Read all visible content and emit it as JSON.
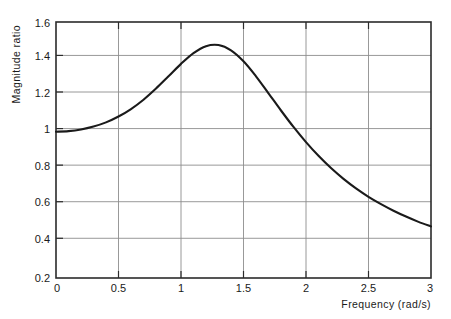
{
  "figure": {
    "clipped_header_text": "",
    "background_color": "#ffffff",
    "frame_color": "#2b2b2b",
    "grid_color": "#8d8d8d",
    "curve_color": "#1a1a1a"
  },
  "axes": {
    "x": {
      "label": "Frequency (rad/s)",
      "ticks": [
        "0",
        "0.5",
        "1",
        "1.5",
        "2",
        "2.5",
        "3"
      ],
      "tick_values": [
        0,
        0.5,
        1,
        1.5,
        2,
        2.5,
        3
      ],
      "min": 0,
      "max": 3
    },
    "y": {
      "label": "Magnitude ratio",
      "ticks": [
        "0.2",
        "0.4",
        "0.6",
        "0.8",
        "1",
        "1.2",
        "1.4",
        "1.6"
      ],
      "tick_values": [
        0.2,
        0.4,
        0.6,
        0.8,
        1,
        1.2,
        1.4,
        1.6
      ],
      "min": 0.2,
      "max": 1.6
    }
  },
  "chart_data": {
    "type": "line",
    "title": "",
    "xlabel": "Frequency (rad/s)",
    "ylabel": "Magnitude ratio",
    "xlim": [
      0,
      3
    ],
    "ylim": [
      0.2,
      1.6
    ],
    "grid": true,
    "legend": null,
    "series": [
      {
        "name": "Magnitude ratio",
        "x": [
          0,
          0.1,
          0.2,
          0.3,
          0.4,
          0.5,
          0.6,
          0.7,
          0.8,
          0.9,
          1.0,
          1.1,
          1.2,
          1.3,
          1.4,
          1.5,
          1.6,
          1.7,
          1.8,
          1.9,
          2.0,
          2.1,
          2.2,
          2.3,
          2.4,
          2.5,
          2.6,
          2.7,
          2.8,
          2.9,
          3.0
        ],
        "y": [
          1.0,
          1.003,
          1.012,
          1.028,
          1.051,
          1.083,
          1.124,
          1.175,
          1.236,
          1.303,
          1.371,
          1.43,
          1.468,
          1.474,
          1.445,
          1.385,
          1.303,
          1.21,
          1.116,
          1.026,
          0.943,
          0.868,
          0.801,
          0.742,
          0.69,
          0.644,
          0.604,
          0.568,
          0.536,
          0.507,
          0.482
        ]
      }
    ],
    "annotations": [
      {
        "text": "peak magnitude ratio",
        "x": 1.25,
        "y": 1.48
      }
    ]
  }
}
